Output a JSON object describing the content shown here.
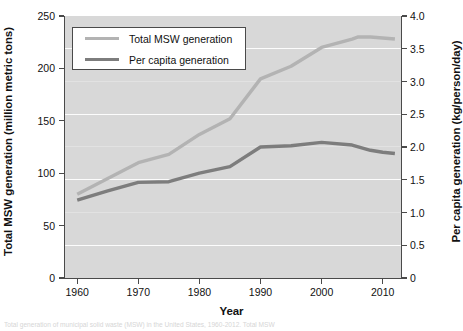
{
  "figure": {
    "width": 463,
    "height": 331,
    "panel_background": "#d8d8d8",
    "page_background": "#ffffff"
  },
  "caption": {
    "text": "Total generation of municipal solid waste (MSW) in the United States, 1960-2012. Total MSW"
  },
  "chart_data": {
    "type": "line",
    "title": "",
    "xlabel": "Year",
    "ylabel": "Total MSW generation (million metric tons)",
    "ylabel_right": "Per capita generation (kg/person/day)",
    "xlim": [
      1958,
      2013
    ],
    "ylim": [
      0,
      250
    ],
    "ylim_right": [
      0,
      4.0
    ],
    "xticks": [
      1960,
      1970,
      1980,
      1990,
      2000,
      2010
    ],
    "xticklabels": [
      "1960",
      "1970",
      "1980",
      "1990",
      "2000",
      "2010"
    ],
    "yticks_left": [
      0,
      50,
      100,
      150,
      200,
      250
    ],
    "yticklabels_left": [
      "0",
      "50",
      "100",
      "150",
      "200",
      "250"
    ],
    "yticks_right": [
      0,
      0.5,
      1.0,
      1.5,
      2.0,
      2.5,
      3.0,
      3.5,
      4.0
    ],
    "yticklabels_right": [
      "0",
      "0.5",
      "1.0",
      "1.5",
      "2.0",
      "2.5",
      "3.0",
      "3.5",
      "4.0"
    ],
    "grid": true,
    "grid_color": "#fcfcfc",
    "legend_position": "upper left",
    "series": [
      {
        "name": "Total MSW generation",
        "axis": "left",
        "color": "#b3b3b3",
        "linewidth": 3.4,
        "x": [
          1960,
          1965,
          1970,
          1975,
          1980,
          1985,
          1990,
          1995,
          2000,
          2005,
          2006,
          2008,
          2010,
          2012
        ],
        "values": [
          80,
          95,
          110,
          118,
          137,
          152,
          190,
          202,
          220,
          228,
          230,
          230,
          229,
          228
        ]
      },
      {
        "name": "Per capita generation",
        "axis": "right",
        "color": "#7d7d7d",
        "linewidth": 3.4,
        "x": [
          1960,
          1965,
          1970,
          1975,
          1980,
          1985,
          1990,
          1995,
          2000,
          2005,
          2008,
          2010,
          2012
        ],
        "values": [
          1.19,
          1.33,
          1.46,
          1.47,
          1.6,
          1.7,
          2.0,
          2.02,
          2.07,
          2.03,
          1.95,
          1.92,
          1.9
        ]
      }
    ]
  },
  "legend": {
    "items": [
      {
        "label": "Total MSW generation",
        "color": "#b3b3b3"
      },
      {
        "label": "Per capita generation",
        "color": "#7d7d7d"
      }
    ]
  }
}
